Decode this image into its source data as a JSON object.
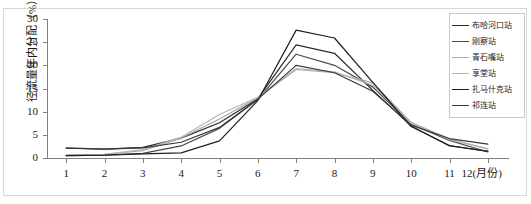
{
  "chart_data": {
    "type": "line",
    "title": "",
    "xlabel": "12(月份)",
    "ylabel": "径流量年内分配（%）",
    "categories": [
      "1",
      "2",
      "3",
      "4",
      "5",
      "6",
      "7",
      "8",
      "9",
      "10",
      "11",
      "12"
    ],
    "x_tick_labels": [
      "1",
      "2",
      "3",
      "4",
      "5",
      "6",
      "7",
      "8",
      "9",
      "10",
      "11",
      "12(月份)"
    ],
    "y_tick_labels": [
      "0",
      "5",
      "10",
      "15",
      "20",
      "25",
      "30"
    ],
    "y_ticks": [
      0,
      5,
      10,
      15,
      20,
      25,
      30
    ],
    "ylim": [
      0,
      30
    ],
    "xlim": [
      1,
      12
    ],
    "grid": false,
    "legend_position": "top-right",
    "series": [
      {
        "name": "布哈河口站",
        "color": "#2b2b2b",
        "values": [
          2.1,
          1.9,
          2.3,
          4.3,
          7.6,
          12.8,
          24.4,
          22.6,
          14.6,
          6.9,
          2.6,
          1.5
        ]
      },
      {
        "name": "刚察站",
        "color": "#4a4a4a",
        "values": [
          0.5,
          0.6,
          1.0,
          2.6,
          6.4,
          12.6,
          22.4,
          20.0,
          15.3,
          7.3,
          3.8,
          1.3
        ]
      },
      {
        "name": "青石嘴站",
        "color": "#a8a8a8",
        "values": [
          0.6,
          0.8,
          1.6,
          4.3,
          8.4,
          13.0,
          19.1,
          18.4,
          16.2,
          7.7,
          4.1,
          2.0
        ]
      },
      {
        "name": "享堂站",
        "color": "#b5b5b5",
        "values": [
          0.6,
          0.8,
          1.8,
          4.5,
          9.4,
          13.1,
          19.3,
          18.6,
          15.7,
          7.5,
          4.0,
          1.9
        ]
      },
      {
        "name": "扎马什克站",
        "color": "#1f1f1f",
        "values": [
          0.5,
          0.6,
          0.9,
          1.1,
          3.7,
          12.4,
          27.6,
          25.9,
          16.3,
          6.8,
          2.7,
          1.4
        ]
      },
      {
        "name": "祁连站",
        "color": "#3a3a3a",
        "values": [
          2.2,
          1.9,
          2.2,
          3.4,
          6.6,
          12.7,
          20.0,
          18.4,
          14.4,
          7.1,
          4.2,
          3.0
        ]
      }
    ]
  }
}
